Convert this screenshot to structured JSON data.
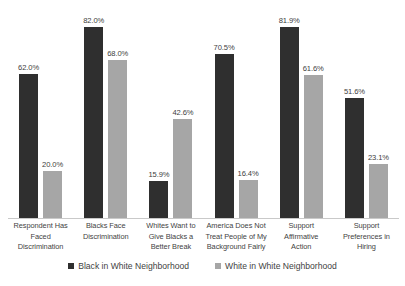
{
  "chart_data": {
    "type": "bar",
    "title": "",
    "subtitle": "",
    "xlabel": "",
    "ylabel": "",
    "ylim": [
      0,
      90
    ],
    "grid": false,
    "legend_position": "bottom",
    "value_suffix": "%",
    "categories": [
      "Respondent Has\nFaced\nDiscrimination",
      "Blacks Face\nDiscrimination",
      "Whites Want to\nGive Blacks a\nBetter Break",
      "America Does Not\nTreat People of My\nBackground Fairly",
      "Support\nAffirmative\nAction",
      "Support\nPreferences in\nHiring"
    ],
    "series": [
      {
        "name": "Black in White Neighborhood",
        "color": "#2f2f2f",
        "values": [
          62.0,
          82.0,
          15.9,
          70.5,
          81.9,
          51.6
        ],
        "labels": [
          "62.0%",
          "82.0%",
          "15.9%",
          "70.5%",
          "81.9%",
          "51.6%"
        ]
      },
      {
        "name": "White in White Neighborhood",
        "color": "#a6a6a6",
        "values": [
          20.0,
          68.0,
          42.6,
          16.4,
          61.6,
          23.1
        ],
        "labels": [
          "20.0%",
          "68.0%",
          "42.6%",
          "16.4%",
          "61.6%",
          "23.1%"
        ]
      }
    ]
  },
  "legend": {
    "items": [
      {
        "label": "Black in White Neighborhood",
        "color": "#2f2f2f"
      },
      {
        "label": "White in White Neighborhood",
        "color": "#a6a6a6"
      }
    ]
  }
}
